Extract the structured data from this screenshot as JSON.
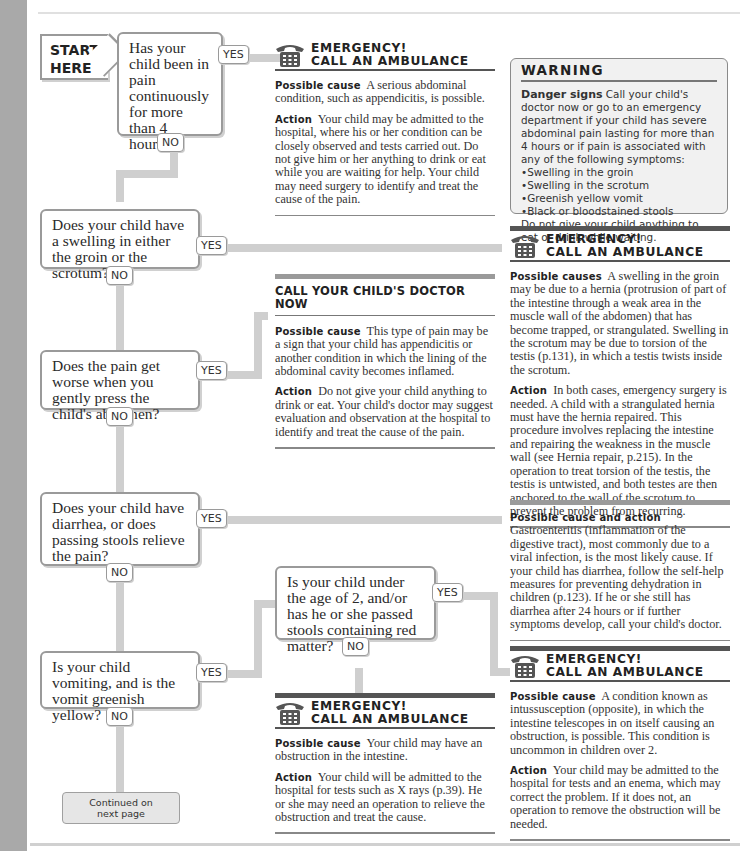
{
  "flowchart": {
    "start_label": [
      "START",
      "HERE"
    ],
    "yes": "YES",
    "no": "NO",
    "questions": [
      "Has your child been in pain continuously for more than 4 hours?",
      "Does your child have a swelling in either the groin or the scrotum?",
      "Does the pain get worse when you gently press the child's abdomen?",
      "Does your child have diarrhea, or does passing stools relieve the pain?",
      "Is your child under the age of 2, and/or has he or she passed stools containing red matter?",
      "Is your child vomiting, and is the vomit greenish yellow?"
    ],
    "continued": [
      "Continued on",
      "next page"
    ]
  },
  "emergency": {
    "title_1": "EMERGENCY!",
    "title_2": "CALL AN AMBULANCE"
  },
  "panels": {
    "pain4h": {
      "cause_label": "Possible cause",
      "cause": "A serious abdominal condition, such as appendicitis, is possible.",
      "action_label": "Action",
      "action": "Your child may be admitted to the hospital, where his or her condition can be closely observed and tests carried out. Do not give him or her anything to drink or eat while you are waiting for help. Your child may need surgery to identify and treat the cause of the pain."
    },
    "swelling": {
      "cause_label": "Possible causes",
      "cause": "A swelling in the groin may be due to a hernia (protrusion of part of the intestine through a weak area in the muscle wall of the abdomen) that has become trapped, or strangulated. Swelling in the scrotum may be due to torsion of the testis (p.131), in which a testis twists inside the scrotum.",
      "action_label": "Action",
      "action": "In both cases, emergency surgery is needed. A child with a strangulated hernia must have the hernia repaired. This procedure involves replacing the intestine and repairing the weakness in the muscle wall (see Hernia repair, p.215). In the operation to treat torsion of the testis, the testis is untwisted, and both testes are then anchored to the wall of the scrotum to prevent the problem from recurring."
    },
    "doctor": {
      "heading": "CALL YOUR CHILD'S DOCTOR NOW",
      "cause_label": "Possible cause",
      "cause": "This type of pain may be a sign that your child has appendicitis or another condition in which the lining of the abdominal cavity becomes inflamed.",
      "action_label": "Action",
      "action": "Do not give your child anything to drink or eat. Your child's doctor may suggest evaluation and observation at the hospital to identify and treat the cause of the pain."
    },
    "gastro": {
      "label": "Possible cause and action",
      "text": "Gastroenteritis (inflammation of the digestive tract), most commonly due to a viral infection, is the most likely cause. If your child has diarrhea, follow the self-help measures for preventing dehydration in children (p.123). If he or she still has diarrhea after 24 hours or if further symptoms develop, call your child's doctor."
    },
    "intuss": {
      "cause_label": "Possible cause",
      "cause": "A condition known as intussusception (opposite), in which the intestine telescopes in on itself causing an obstruction, is possible. This condition is uncommon in children over 2.",
      "action_label": "Action",
      "action": "Your child may be admitted to the hospital for tests and an enema, which may correct the problem. If it does not, an operation to remove the obstruction will be needed."
    },
    "obstruct": {
      "cause_label": "Possible cause",
      "cause": "Your child may have an obstruction in the intestine.",
      "action_label": "Action",
      "action": "Your child will be admitted to the hospital for tests such as X rays (p.39). He or she may need an operation to relieve the obstruction and treat the cause."
    }
  },
  "warning": {
    "title": "WARNING",
    "label": "Danger signs",
    "intro": "Call your child's doctor now or go to an emergency department if your child has severe abdominal pain lasting for more than 4 hours or if pain is associated with any of the following symptoms:",
    "items": [
      "Swelling in the groin",
      "Swelling in the scrotum",
      "Greenish yellow vomit",
      "Black or bloodstained stools"
    ],
    "outro": "Do not give your child anything to eat or drink while waiting."
  },
  "colors": {
    "connector": "#cfcfcf",
    "side_bar": "#a9a9a9",
    "rule_dark": "#555555"
  }
}
